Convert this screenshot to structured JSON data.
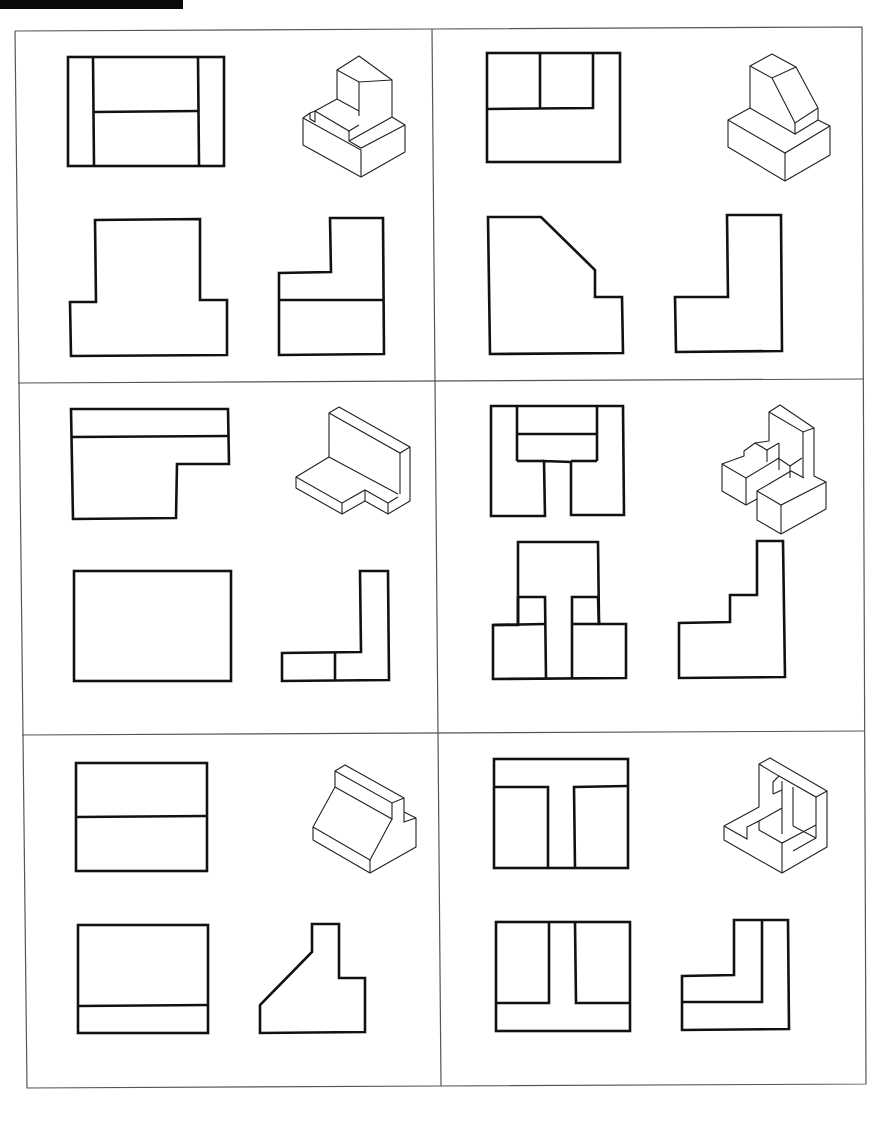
{
  "sheet": {
    "title": "Orthographic projection exercise sheet",
    "layout": {
      "rows": 3,
      "columns": 2
    },
    "colors": {
      "line": "#111111",
      "frame": "#555555",
      "background": "#ffffff",
      "header_bar": "#0a0a0a"
    }
  },
  "panels": [
    {
      "id": 1,
      "position": "row1-left",
      "views": [
        "top-view",
        "isometric-view",
        "front-view",
        "side-view"
      ],
      "isometric": "stepped block with L-shaped riser and slot"
    },
    {
      "id": 2,
      "position": "row1-right",
      "views": [
        "top-view",
        "isometric-view",
        "front-view",
        "side-view"
      ],
      "isometric": "rectangular base with chamfered upright block"
    },
    {
      "id": 3,
      "position": "row2-left",
      "views": [
        "top-view",
        "isometric-view",
        "front-view",
        "side-view"
      ],
      "isometric": "L-bracket with back wall and notched base"
    },
    {
      "id": 4,
      "position": "row2-right",
      "views": [
        "top-view",
        "isometric-view",
        "front-view",
        "side-view"
      ],
      "isometric": "multi-block cluster with tall back wall"
    },
    {
      "id": 5,
      "position": "row3-left",
      "views": [
        "top-view",
        "isometric-view",
        "front-view",
        "side-view"
      ],
      "isometric": "inclined ramp block with rear rib"
    },
    {
      "id": 6,
      "position": "row3-right",
      "views": [
        "top-view",
        "isometric-view",
        "front-view",
        "side-view"
      ],
      "isometric": "corner block with stepped channel"
    }
  ]
}
